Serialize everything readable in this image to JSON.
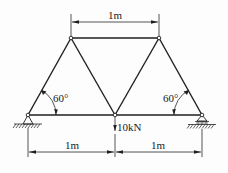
{
  "diagram": {
    "type": "truss",
    "title": "",
    "colors": {
      "line": "#1f1f1f",
      "background": "#fdfdfd"
    },
    "nodes": {
      "left_support": {
        "x": 28,
        "y": 115
      },
      "bottom_center": {
        "x": 115,
        "y": 115
      },
      "right_support": {
        "x": 202,
        "y": 115
      },
      "top_left": {
        "x": 71,
        "y": 38
      },
      "top_right": {
        "x": 159,
        "y": 38
      }
    },
    "members": [
      [
        "left_support",
        "bottom_center"
      ],
      [
        "bottom_center",
        "right_support"
      ],
      [
        "top_left",
        "top_right"
      ],
      [
        "left_support",
        "top_left"
      ],
      [
        "top_left",
        "bottom_center"
      ],
      [
        "bottom_center",
        "top_right"
      ],
      [
        "top_right",
        "right_support"
      ]
    ],
    "dimensions": {
      "top_span": "1m",
      "bottom_left_span": "1m",
      "bottom_right_span": "1m"
    },
    "angles": {
      "left": "60°",
      "right": "60°"
    },
    "load": {
      "label": "10kN",
      "direction": "down",
      "node": "bottom_center"
    },
    "supports": {
      "left": "pin",
      "right": "roller"
    }
  }
}
